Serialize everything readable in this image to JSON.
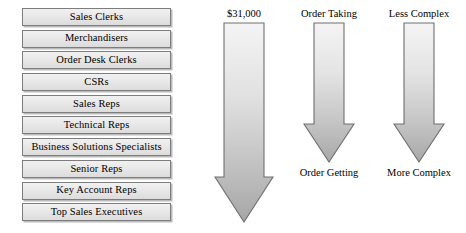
{
  "diagram": {
    "type": "sales-role-continuum",
    "background_color": "#ffffff",
    "text_color": "#000000",
    "box_border_color": "#7d7d7d",
    "box_fill_top": "#f1f1f1",
    "box_fill_bottom": "#dcdcdc",
    "arrow_outline_color": "#6e6e6e",
    "arrow_fill_top": "#f2f2f2",
    "arrow_fill_bottom": "#a8a8a8"
  },
  "roles": {
    "items": [
      {
        "label": "Sales Clerks"
      },
      {
        "label": "Merchandisers"
      },
      {
        "label": "Order Desk Clerks"
      },
      {
        "label": "CSRs"
      },
      {
        "label": "Sales Reps"
      },
      {
        "label": "Technical Reps"
      },
      {
        "label": "Business Solutions Specialists"
      },
      {
        "label": "Senior Reps"
      },
      {
        "label": "Key Account Reps"
      },
      {
        "label": "Top Sales Executives"
      }
    ]
  },
  "arrows": [
    {
      "name": "revenue",
      "top_label": "$31,000",
      "bottom_label": "",
      "direction": "down"
    },
    {
      "name": "order-role",
      "top_label": "Order Taking",
      "bottom_label": "Order Getting",
      "direction": "down"
    },
    {
      "name": "complexity",
      "top_label": "Less Complex",
      "bottom_label": "More Complex",
      "direction": "down"
    }
  ]
}
